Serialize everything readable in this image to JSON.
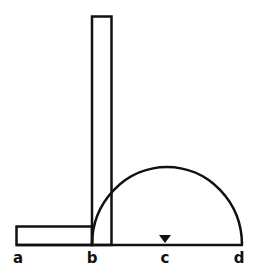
{
  "diagram": {
    "labels": {
      "a": "a",
      "b": "b",
      "c": "c",
      "d": "d"
    },
    "colors": {
      "stroke": "#111111",
      "background": "#ffffff"
    }
  }
}
